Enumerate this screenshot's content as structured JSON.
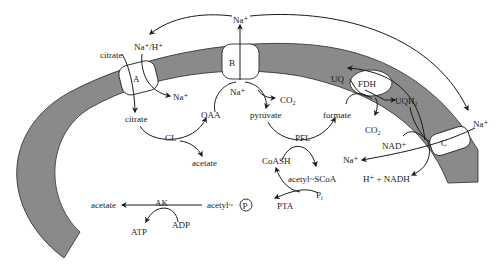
{
  "figure": {
    "colors": {
      "membrane": "#8a8a8a",
      "line": "#1a1a1a",
      "background": "#ffffff"
    },
    "transporters": {
      "a": "A",
      "b": "B",
      "c": "C",
      "fdh": "FDH"
    },
    "labels": {
      "na_top": "Na⁺",
      "na_h_antiport": "Na⁺/H⁺",
      "citrate_out": "citrate",
      "na_out_a": "Na⁺",
      "citrate_in": "citrate",
      "cl_enzyme": "CL",
      "acetate_cl": "acetate",
      "oaa": "OAA",
      "na_in_b": "Na⁺",
      "co2_b": "CO",
      "co2_b_sub": "2",
      "pyruvate": "pyruvate",
      "pfl_enzyme": "PFL",
      "formate": "formate",
      "uq": "UQ",
      "uqh2": "UQH",
      "uqh2_sub": "2",
      "co2_fdh": "CO",
      "co2_fdh_sub": "2",
      "nad_plus": "NAD⁺",
      "na_in_c": "Na⁺",
      "na_out_c": "Na⁺",
      "h_nadh": "H⁺ + NADH",
      "coash": "CoASH",
      "acetyl_scoa": "acetyl~SCoA",
      "pi": "P",
      "pi_sub": "i",
      "pta_enzyme": "PTA",
      "acetyl_p": "acetyl~",
      "phosphate_circle": "P",
      "acetate_ak": "acetate",
      "ak_enzyme": "AK",
      "adp": "ADP",
      "atp": "ATP"
    }
  }
}
